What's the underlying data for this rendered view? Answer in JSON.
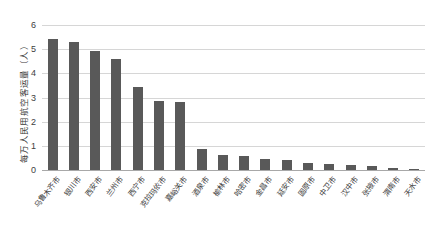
{
  "chart_data": {
    "type": "bar",
    "title": "",
    "xlabel": "",
    "ylabel": "每万人民用航空客运量（人）",
    "ylim": [
      0,
      6
    ],
    "yticks": [
      0,
      1,
      2,
      3,
      4,
      5,
      6
    ],
    "grid": true,
    "legend": "none",
    "bar_color": "#595959",
    "categories": [
      "乌鲁木齐市",
      "银川市",
      "西安市",
      "兰州市",
      "西宁市",
      "克拉玛依市",
      "嘉峪关市",
      "酒泉市",
      "榆林市",
      "哈密市",
      "金昌市",
      "延安市",
      "固原市",
      "中卫市",
      "汉中市",
      "张掖市",
      "渭南市",
      "天水市"
    ],
    "values": [
      5.42,
      5.28,
      4.94,
      4.6,
      3.45,
      2.86,
      2.82,
      0.85,
      0.62,
      0.56,
      0.44,
      0.4,
      0.3,
      0.26,
      0.2,
      0.16,
      0.1,
      0.06
    ]
  }
}
